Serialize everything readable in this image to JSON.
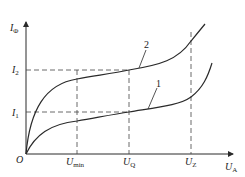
{
  "diagram": {
    "type": "characteristic-curves",
    "y_axis": {
      "symbol": "I",
      "subscript": "Φ"
    },
    "x_axis": {
      "symbol": "U",
      "subscript": "A"
    },
    "origin_label": "O",
    "y_marks": [
      {
        "symbol": "I",
        "subscript": "2"
      },
      {
        "symbol": "I",
        "subscript": "1"
      }
    ],
    "x_marks": [
      {
        "symbol": "U",
        "subscript": "min"
      },
      {
        "symbol": "U",
        "subscript": "Q"
      },
      {
        "symbol": "U",
        "subscript": "Z"
      }
    ],
    "curves": [
      {
        "label": "1"
      },
      {
        "label": "2"
      }
    ],
    "colors": {
      "line": "#2a2a2a",
      "background": "#ffffff"
    }
  }
}
